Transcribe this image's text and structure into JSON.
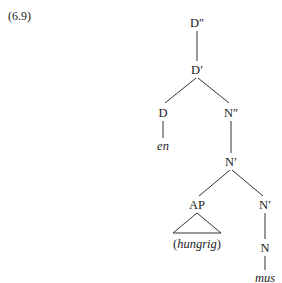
{
  "example_number": "(6.9)",
  "tree": {
    "root": "D″",
    "nodes": [
      {
        "id": "dpp",
        "label": "D″",
        "x": 197,
        "y": 23
      },
      {
        "id": "dp",
        "label": "D′",
        "x": 197,
        "y": 70
      },
      {
        "id": "d",
        "label": "D",
        "x": 163,
        "y": 113
      },
      {
        "id": "npp",
        "label": "N″",
        "x": 231,
        "y": 113
      },
      {
        "id": "en",
        "label": "en",
        "x": 163,
        "y": 146,
        "leaf": true
      },
      {
        "id": "np1",
        "label": "N′",
        "x": 231,
        "y": 162
      },
      {
        "id": "ap",
        "label": "AP",
        "x": 197,
        "y": 205
      },
      {
        "id": "np2",
        "label": "N′",
        "x": 265,
        "y": 205
      },
      {
        "id": "hungrig",
        "label": "(hungrig)",
        "x": 197,
        "y": 244
      },
      {
        "id": "n",
        "label": "N",
        "x": 265,
        "y": 248
      },
      {
        "id": "mus",
        "label": "mus",
        "x": 265,
        "y": 278,
        "leaf": true
      }
    ],
    "edges": [
      [
        "dpp",
        "dp"
      ],
      [
        "dp",
        "d"
      ],
      [
        "dp",
        "npp"
      ],
      [
        "d",
        "en"
      ],
      [
        "npp",
        "np1"
      ],
      [
        "np1",
        "ap"
      ],
      [
        "np1",
        "np2"
      ],
      [
        "np2",
        "n"
      ],
      [
        "n",
        "mus"
      ]
    ],
    "triangle_under": "ap"
  },
  "labels": {
    "dpp": "D″",
    "dp": "D′",
    "d": "D",
    "npp": "N″",
    "en": "en",
    "np1": "N′",
    "ap": "AP",
    "np2": "N′",
    "hungrig_open": "(",
    "hungrig_word": "hungrig",
    "hungrig_close": ")",
    "n": "N",
    "mus": "mus"
  }
}
